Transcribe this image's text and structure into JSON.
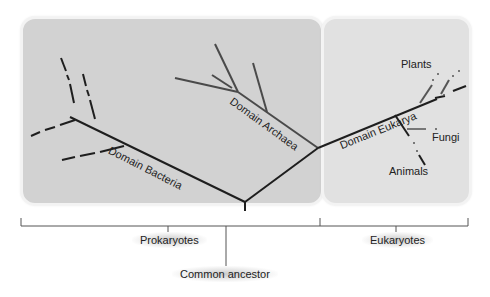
{
  "diagram": {
    "type": "phylogenetic-tree",
    "colors": {
      "prokaryote_panel": "#d2d2d2",
      "eukaryote_panel": "#e1e1e1",
      "main_branch": "#1e1e1e",
      "archaea_branch": "#4a4a4a",
      "gray_branch": "#666666"
    },
    "domains": {
      "bacteria": "Domain Bacteria",
      "archaea": "Domain Archaea",
      "eukarya": "Domain Eukarya"
    },
    "groups": {
      "plants": "Plants",
      "fungi": "Fungi",
      "animals": "Animals"
    },
    "brackets": {
      "prokaryotes": "Prokaryotes",
      "eukaryotes": "Eukaryotes"
    },
    "root_label": "Common ancestor"
  }
}
